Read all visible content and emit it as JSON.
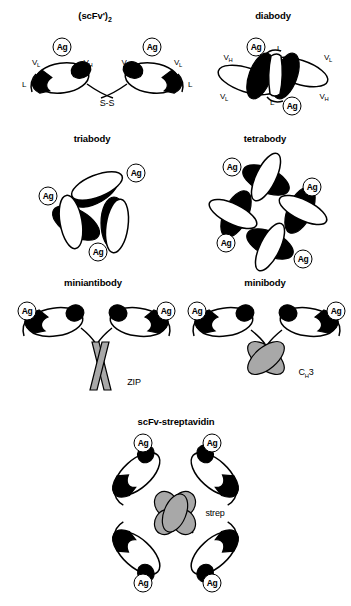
{
  "figure": {
    "title_visible": false,
    "background": "#ffffff",
    "ink": "#000000",
    "gray_fill": "#a8a8a8"
  },
  "panels": [
    {
      "id": "scfv2",
      "title": "(scFv')",
      "title_sub": "2",
      "ag_labels": [
        "Ag",
        "Ag"
      ],
      "domain_labels": [
        "V",
        "V",
        "V",
        "V"
      ],
      "domain_subs": [
        "L",
        "H",
        "H",
        "L"
      ],
      "linker_labels": [
        "L",
        "L"
      ],
      "bond_label": "S-S"
    },
    {
      "id": "diabody",
      "title": "diabody",
      "ag_labels": [
        "Ag",
        "Ag"
      ],
      "domain_labels": [
        "V",
        "V",
        "V",
        "V"
      ],
      "domain_subs": [
        "H",
        "L",
        "L",
        "H"
      ],
      "linker_labels": [
        "L",
        "L"
      ]
    },
    {
      "id": "triabody",
      "title": "triabody",
      "ag_labels": [
        "Ag",
        "Ag",
        "Ag"
      ]
    },
    {
      "id": "tetrabody",
      "title": "tetrabody",
      "ag_labels": [
        "Ag",
        "Ag",
        "Ag",
        "Ag"
      ]
    },
    {
      "id": "miniantibody",
      "title": "miniantibody",
      "ag_labels": [
        "Ag",
        "Ag"
      ],
      "core_label": "ZIP"
    },
    {
      "id": "minibody",
      "title": "minibody",
      "ag_labels": [
        "Ag",
        "Ag"
      ],
      "core_label": "C",
      "core_label_sub": "H",
      "core_label_tail": "3"
    },
    {
      "id": "scfv-streptavidin",
      "title": "scFv-streptavidin",
      "ag_labels": [
        "Ag",
        "Ag",
        "Ag",
        "Ag"
      ],
      "core_label": "strep"
    }
  ]
}
